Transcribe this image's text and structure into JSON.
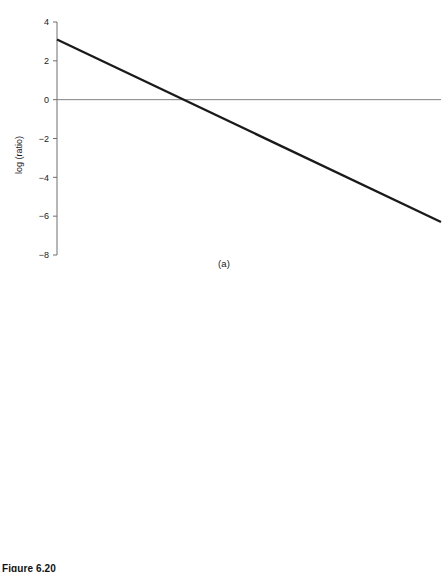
{
  "figure": {
    "number_label": "Figure 6.20",
    "panel_a_caption": "(a)",
    "panel_b_caption": "(b)"
  },
  "colors": {
    "data_line": "#1a1a1a",
    "zero_line": "#808080",
    "axis": "#6e6e6e",
    "text": "#1a1a1a",
    "background": "#ffffff"
  },
  "chart_data": [
    {
      "id": "panel-a",
      "type": "line",
      "title": "",
      "panel": "(a)",
      "xlabel": "",
      "ylabel": "log (ratio)",
      "ylim": [
        -8,
        4
      ],
      "xlim": [
        0,
        1
      ],
      "yticks": [
        4,
        2,
        0,
        -2,
        -4,
        -6,
        -8
      ],
      "ytick_labels": [
        "4",
        "2",
        "0",
        "-2",
        "-4",
        "-6",
        "-8"
      ],
      "xticks": [],
      "xtick_labels": [],
      "grid": false,
      "legend": "none",
      "reference_lines": [
        {
          "name": "zero-line",
          "orientation": "horizontal",
          "value": 0,
          "color": "#808080"
        }
      ],
      "series": [
        {
          "name": "First to second",
          "style": "thick-solid",
          "color": "#1a1a1a",
          "x": [
            0,
            1
          ],
          "y": [
            3.1,
            -6.3
          ]
        }
      ]
    },
    {
      "id": "panel-b",
      "type": "line",
      "title": "",
      "panel": "(b)",
      "xlabel": "",
      "ylabel": "log (ratio)",
      "ylim": [
        -10,
        10
      ],
      "xlim": [
        0,
        1
      ],
      "yticks": [
        10,
        8,
        6,
        4,
        2,
        0,
        -2,
        -4,
        -6,
        -8,
        -10
      ],
      "ytick_labels": [
        "10",
        "8",
        "6",
        "4",
        "2",
        "0",
        "-2",
        "-4",
        "-6",
        "-8",
        "-10"
      ],
      "xticks": [],
      "xtick_labels": [],
      "grid": false,
      "legend": "annotations",
      "reference_lines": [
        {
          "name": "zero-line",
          "orientation": "horizontal",
          "value": 0,
          "color": "#808080"
        }
      ],
      "series": [
        {
          "name": "Second to third",
          "style": "thin-solid",
          "color": "#1a1a1a",
          "x": [
            0,
            1
          ],
          "y": [
            7.4,
            -8.4
          ]
        },
        {
          "name": "First to second",
          "style": "thick-solid",
          "color": "#1a1a1a",
          "x": [
            0,
            1
          ],
          "y": [
            3.1,
            -6.3
          ]
        }
      ],
      "annotations": [
        {
          "name": "second-to-third",
          "text": "Second to third",
          "text_x": 0.455,
          "text_y": 3.95,
          "arrow_tip_x": 0.4,
          "arrow_tip_y": 4.1,
          "anchor_x": 0.275,
          "anchor_y": 2.2
        },
        {
          "name": "first-to-second",
          "text": "First to second",
          "text_x": 0.135,
          "text_y": -4.1,
          "arrow_tip_x": 0.215,
          "arrow_tip_y": -2.5,
          "anchor_x": 0.345,
          "anchor_y": -0.1
        }
      ]
    }
  ]
}
